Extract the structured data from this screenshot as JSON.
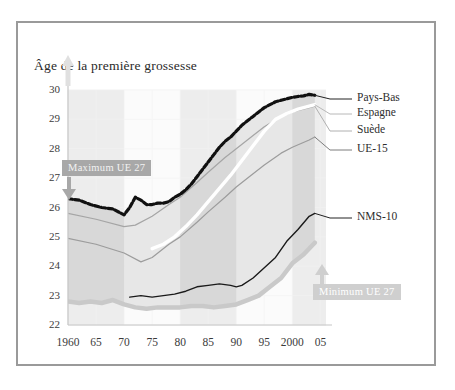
{
  "chart_data": {
    "type": "line",
    "title": "Âge de la première grossesse",
    "xlabel": "",
    "ylabel": "",
    "xlim": [
      1960,
      2006
    ],
    "ylim": [
      22,
      30
    ],
    "grid": true,
    "legend_position": "right",
    "y_ticks": [
      30,
      29,
      28,
      27,
      26,
      25,
      24,
      23,
      22
    ],
    "x_ticks": [
      {
        "value": 1960,
        "label": "1960"
      },
      {
        "value": 1965,
        "label": "65"
      },
      {
        "value": 1970,
        "label": "70"
      },
      {
        "value": 1975,
        "label": "75"
      },
      {
        "value": 1980,
        "label": "80"
      },
      {
        "value": 1985,
        "label": "85"
      },
      {
        "value": 1990,
        "label": "90"
      },
      {
        "value": 1995,
        "label": "95"
      },
      {
        "value": 2000,
        "label": "2000"
      },
      {
        "value": 2005,
        "label": "05"
      }
    ],
    "annotations": [
      {
        "name": "maximum-band-label",
        "text": "Maximum UE 27",
        "style": "dark"
      },
      {
        "name": "minimum-band-label",
        "text": "Minimum UE 27",
        "style": "light"
      }
    ],
    "series": [
      {
        "name": "Pays-Bas",
        "label": "Pays-Bas",
        "color": "#111111",
        "style": "dotted-thick",
        "x": [
          1960,
          1962,
          1964,
          1966,
          1968,
          1970,
          1971,
          1972,
          1973,
          1974,
          1975,
          1976,
          1977,
          1978,
          1979,
          1980,
          1981,
          1982,
          1983,
          1984,
          1985,
          1986,
          1987,
          1988,
          1989,
          1990,
          1991,
          1992,
          1993,
          1994,
          1995,
          1996,
          1997,
          1998,
          1999,
          2000,
          2001,
          2002,
          2003,
          2004
        ],
        "values": [
          26.3,
          26.25,
          26.1,
          26.0,
          25.95,
          25.75,
          26.0,
          26.35,
          26.25,
          26.1,
          26.1,
          26.15,
          26.15,
          26.2,
          26.35,
          26.45,
          26.6,
          26.8,
          27.05,
          27.3,
          27.55,
          27.8,
          28.05,
          28.25,
          28.4,
          28.6,
          28.8,
          28.95,
          29.1,
          29.25,
          29.4,
          29.5,
          29.6,
          29.65,
          29.7,
          29.75,
          29.78,
          29.8,
          29.85,
          29.82
        ]
      },
      {
        "name": "Espagne",
        "label": "Espagne",
        "color": "#ffffff",
        "style": "thick-white",
        "x": [
          1975,
          1977,
          1979,
          1981,
          1983,
          1985,
          1987,
          1989,
          1991,
          1993,
          1995,
          1997,
          1999,
          2001,
          2003,
          2004
        ],
        "values": [
          24.6,
          24.75,
          25.0,
          25.35,
          25.75,
          26.2,
          26.65,
          27.1,
          27.6,
          28.1,
          28.6,
          29.0,
          29.2,
          29.35,
          29.45,
          29.5
        ]
      },
      {
        "name": "Suède",
        "label": "Suède",
        "color": "#a5a5a5",
        "style": "thin-gray",
        "x": [
          1960,
          1965,
          1970,
          1972,
          1975,
          1978,
          1980,
          1983,
          1985,
          1988,
          1990,
          1993,
          1995,
          1998,
          2000,
          2003,
          2004
        ],
        "values": [
          25.8,
          25.6,
          25.35,
          25.4,
          25.7,
          26.1,
          26.35,
          26.85,
          27.2,
          27.7,
          28.0,
          28.45,
          28.75,
          29.1,
          29.25,
          29.4,
          29.45
        ]
      },
      {
        "name": "UE-15",
        "label": "UE-15",
        "color": "#9c9c9c",
        "style": "thin-gray",
        "x": [
          1960,
          1965,
          1970,
          1973,
          1975,
          1978,
          1980,
          1983,
          1985,
          1988,
          1990,
          1993,
          1995,
          1998,
          2000,
          2003,
          2004
        ],
        "values": [
          24.95,
          24.75,
          24.45,
          24.15,
          24.3,
          24.75,
          25.0,
          25.5,
          25.85,
          26.35,
          26.7,
          27.15,
          27.45,
          27.85,
          28.05,
          28.3,
          28.4
        ]
      },
      {
        "name": "NMS-10",
        "label": "NMS-10",
        "color": "#1a1a1a",
        "style": "thin-black",
        "x": [
          1971,
          1973,
          1975,
          1977,
          1979,
          1981,
          1983,
          1985,
          1987,
          1989,
          1990,
          1991,
          1993,
          1995,
          1997,
          1999,
          2001,
          2003,
          2004
        ],
        "values": [
          22.95,
          23.0,
          22.95,
          23.0,
          23.05,
          23.15,
          23.3,
          23.35,
          23.4,
          23.35,
          23.3,
          23.35,
          23.6,
          23.95,
          24.3,
          24.85,
          25.25,
          25.7,
          25.8
        ]
      }
    ],
    "bands": [
      {
        "name": "Maximum UE 27",
        "role": "upper-envelope",
        "color": "#111111",
        "x": [
          1960,
          1962,
          1964,
          1966,
          1968,
          1970,
          1971,
          1972,
          1973,
          1974,
          1975,
          1976,
          1977,
          1978,
          1979,
          1980,
          1981,
          1982,
          1983,
          1984,
          1985,
          1986,
          1987,
          1988,
          1989,
          1990,
          1991,
          1992,
          1993,
          1994,
          1995,
          1996,
          1997,
          1998,
          1999,
          2000,
          2001,
          2002,
          2003,
          2004
        ],
        "values": [
          26.3,
          26.25,
          26.1,
          26.0,
          25.95,
          25.75,
          26.0,
          26.35,
          26.25,
          26.1,
          26.1,
          26.15,
          26.15,
          26.2,
          26.35,
          26.45,
          26.6,
          26.8,
          27.05,
          27.3,
          27.55,
          27.8,
          28.05,
          28.25,
          28.4,
          28.6,
          28.8,
          28.95,
          29.1,
          29.25,
          29.4,
          29.5,
          29.6,
          29.65,
          29.7,
          29.75,
          29.78,
          29.8,
          29.85,
          29.82
        ]
      },
      {
        "name": "Minimum UE 27",
        "role": "lower-envelope",
        "color": "#c9c9c9",
        "x": [
          1960,
          1962,
          1964,
          1966,
          1968,
          1970,
          1972,
          1974,
          1976,
          1978,
          1980,
          1982,
          1984,
          1986,
          1988,
          1990,
          1992,
          1994,
          1996,
          1998,
          2000,
          2002,
          2004
        ],
        "values": [
          22.8,
          22.75,
          22.8,
          22.75,
          22.85,
          22.7,
          22.6,
          22.55,
          22.6,
          22.6,
          22.6,
          22.65,
          22.65,
          22.6,
          22.65,
          22.7,
          22.85,
          23.0,
          23.3,
          23.6,
          24.1,
          24.4,
          24.8
        ]
      }
    ],
    "stripe_bands": [
      {
        "start": 1960,
        "end": 1970,
        "shade": "dark"
      },
      {
        "start": 1970,
        "end": 1980,
        "shade": "light"
      },
      {
        "start": 1980,
        "end": 1990,
        "shade": "dark"
      },
      {
        "start": 1990,
        "end": 2000,
        "shade": "light"
      },
      {
        "start": 2000,
        "end": 2006,
        "shade": "dark"
      }
    ],
    "colors": {
      "band_fill_dark": "#d2d2d2",
      "band_fill_light": "#e2e2e2",
      "gridline": "#f0f0f0",
      "frame": "#9a9a9a",
      "pill_dark": "#a8a8a8",
      "pill_light": "#cfcfcf",
      "text": "#2e2e2e"
    }
  }
}
